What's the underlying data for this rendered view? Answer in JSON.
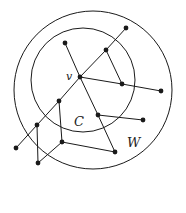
{
  "labels": {
    "v": "v",
    "C": "C",
    "W": "W"
  },
  "colors": {
    "stroke": "#1a1a1a",
    "background": "#ffffff"
  },
  "circles": [
    {
      "name": "W",
      "cx": 93,
      "cy": 90,
      "r": 79
    },
    {
      "name": "C",
      "cx": 83,
      "cy": 80,
      "r": 52
    }
  ],
  "nodes": [
    {
      "id": "A",
      "x": 126,
      "y": 28
    },
    {
      "id": "B",
      "x": 65,
      "y": 43
    },
    {
      "id": "D",
      "x": 106,
      "y": 50
    },
    {
      "id": "v",
      "x": 80,
      "y": 77
    },
    {
      "id": "E",
      "x": 122,
      "y": 84
    },
    {
      "id": "F",
      "x": 161,
      "y": 91
    },
    {
      "id": "G",
      "x": 59,
      "y": 101
    },
    {
      "id": "H",
      "x": 98,
      "y": 115
    },
    {
      "id": "I",
      "x": 143,
      "y": 120
    },
    {
      "id": "J",
      "x": 37,
      "y": 125
    },
    {
      "id": "K",
      "x": 62,
      "y": 142
    },
    {
      "id": "L",
      "x": 16,
      "y": 148
    },
    {
      "id": "M",
      "x": 115,
      "y": 152
    },
    {
      "id": "N",
      "x": 38,
      "y": 163
    }
  ],
  "edges": [
    [
      "L",
      "J"
    ],
    [
      "J",
      "G"
    ],
    [
      "G",
      "v"
    ],
    [
      "v",
      "D"
    ],
    [
      "D",
      "A"
    ],
    [
      "B",
      "v"
    ],
    [
      "v",
      "H"
    ],
    [
      "H",
      "M"
    ],
    [
      "D",
      "E"
    ],
    [
      "v",
      "E"
    ],
    [
      "E",
      "F"
    ],
    [
      "H",
      "I"
    ],
    [
      "G",
      "K"
    ],
    [
      "K",
      "M"
    ],
    [
      "J",
      "N"
    ],
    [
      "N",
      "K"
    ]
  ]
}
